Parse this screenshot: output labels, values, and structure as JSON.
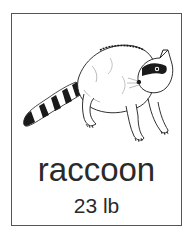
{
  "card": {
    "animal_name": "raccoon",
    "weight": "23 lb",
    "illustration": "raccoon-illustration"
  },
  "colors": {
    "border": "#555555",
    "text": "#2a2a2a",
    "ink": "#1a1a1a",
    "background": "#ffffff"
  }
}
